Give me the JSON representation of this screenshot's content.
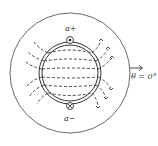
{
  "diagram": {
    "title": "",
    "labels": {
      "coil_top": "a+",
      "coil_bottom": "a−",
      "angle": "θ = 0°"
    },
    "symbols": {
      "coil_top": "dot (current out of page)",
      "coil_bottom": "cross (current into page)"
    },
    "elements": [
      "outer-stator-circle",
      "rotor-double-ring",
      "flux-lines-dashed",
      "reference-arrow"
    ],
    "colors": {
      "stroke": "#333333",
      "background": "#ffffff"
    }
  }
}
